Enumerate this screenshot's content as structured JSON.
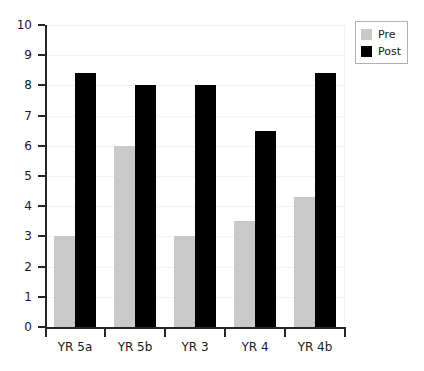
{
  "chart_data": {
    "type": "bar",
    "title": "",
    "xlabel": "",
    "ylabel": "",
    "categories": [
      "YR 5a",
      "YR 5b",
      "YR 3",
      "YR 4",
      "YR 4b"
    ],
    "series": [
      {
        "name": "Pre",
        "color": "#c9c9c9",
        "values": [
          3,
          6,
          3,
          3.5,
          4.3
        ]
      },
      {
        "name": "Post",
        "color": "#000000",
        "values": [
          8.4,
          8,
          8,
          6.5,
          8.4
        ]
      }
    ],
    "ylim": [
      0,
      10
    ],
    "yticks": [
      0,
      1,
      2,
      3,
      4,
      5,
      6,
      7,
      8,
      9,
      10
    ],
    "ytick_labels": [
      "0",
      "1",
      "2",
      "3",
      "4",
      "5",
      "6",
      "7",
      "8",
      "9",
      "10"
    ],
    "grid": true,
    "legend_position": "top-right",
    "legend_entries": [
      "Pre",
      "Post"
    ]
  }
}
